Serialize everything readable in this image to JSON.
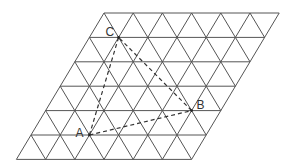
{
  "diagram": {
    "type": "triangular-grid-parallelogram",
    "grid": {
      "columns": 6,
      "rows": 6,
      "origin_x": 104,
      "origin_y": 13,
      "dx": 29.2,
      "dy": 24.4,
      "line_color": "#555555"
    },
    "points": [
      {
        "label": "A",
        "row": 5,
        "col": 2
      },
      {
        "label": "B",
        "row": 4,
        "col": 5
      },
      {
        "label": "C",
        "row": 1,
        "col": 1
      }
    ],
    "triangle_style": "dashed"
  }
}
